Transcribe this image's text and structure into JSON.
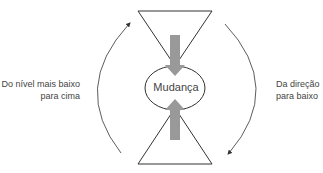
{
  "diagram": {
    "center_label": "Mudança",
    "left_label_line1": "Do nível mais baixo",
    "left_label_line2": "para cima",
    "right_label_line1": "Da direção",
    "right_label_line2": "para baixo"
  },
  "colors": {
    "stroke": "#333333",
    "arrow_fill": "#999999",
    "text": "#444444"
  }
}
